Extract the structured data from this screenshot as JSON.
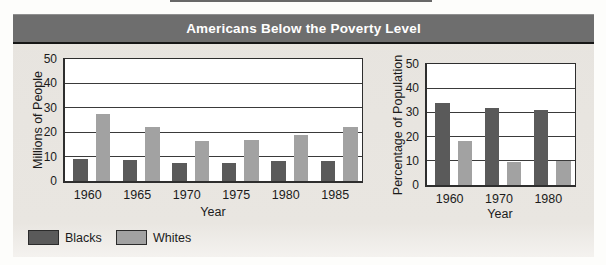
{
  "title": "Americans Below the Poverty Level",
  "legend": {
    "items": [
      {
        "label": "Blacks",
        "color": "#5a5a5a"
      },
      {
        "label": "Whites",
        "color": "#a2a2a2"
      }
    ]
  },
  "colors": {
    "title_bar": "#6e6e6e",
    "panel_background": "#e9e6e1",
    "plot_background": "#ffffff",
    "blacks_bar": "#5a5a5a",
    "whites_bar": "#a2a2a2"
  },
  "chart_data": [
    {
      "type": "bar",
      "title": "Americans Below the Poverty Level",
      "categories": [
        "1960",
        "1965",
        "1970",
        "1975",
        "1980",
        "1985"
      ],
      "series": [
        {
          "name": "Blacks",
          "color": "#5a5a5a",
          "values": [
            9.2,
            8.5,
            7.4,
            7.3,
            8.2,
            8.4
          ]
        },
        {
          "name": "Whites",
          "color": "#a2a2a2",
          "values": [
            27.5,
            22,
            16.5,
            17,
            19,
            22.2
          ]
        }
      ],
      "xlabel": "Year",
      "ylabel": "Millions of People",
      "ylim": [
        0,
        50
      ],
      "yticks": [
        0,
        10,
        20,
        30,
        40,
        50
      ],
      "grid": true,
      "legend_position": "bottom-left"
    },
    {
      "type": "bar",
      "title": "Americans Below the Poverty Level",
      "categories": [
        "1960",
        "1970",
        "1980"
      ],
      "series": [
        {
          "name": "Blacks",
          "color": "#5a5a5a",
          "values": [
            34,
            32,
            31
          ]
        },
        {
          "name": "Whites",
          "color": "#a2a2a2",
          "values": [
            18,
            9.5,
            10
          ]
        }
      ],
      "xlabel": "Year",
      "ylabel": "Percentage of Population",
      "ylim": [
        0,
        50
      ],
      "yticks": [
        0,
        10,
        20,
        30,
        40,
        50
      ],
      "grid": true,
      "legend_position": "bottom-left"
    }
  ]
}
